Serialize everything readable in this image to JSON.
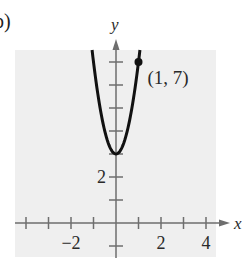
{
  "figure": {
    "part_label": "b)",
    "point_label": "(1, 7)",
    "x_axis_label": "x",
    "y_axis_label": "y",
    "x_tick_labels": [
      {
        "value": -2,
        "text": "−2"
      },
      {
        "value": 2,
        "text": "2"
      },
      {
        "value": 4,
        "text": "4"
      }
    ],
    "y_tick_labels": [
      {
        "value": 2,
        "text": "2"
      }
    ],
    "colors": {
      "background": "#ffffff",
      "plot_area": "#efefef",
      "axis": "#6e6e6e",
      "curve": "#111111",
      "point": "#111111"
    }
  },
  "chart_data": {
    "type": "line",
    "title": "",
    "xlabel": "x",
    "ylabel": "y",
    "function": "y = 4x^2 + 3",
    "series": [
      {
        "name": "parabola",
        "x": [
          -1.2,
          -1.0,
          -0.75,
          -0.5,
          -0.25,
          0,
          0.25,
          0.5,
          0.75,
          1.0,
          1.2
        ],
        "y": [
          8.76,
          7,
          5.25,
          4,
          3.25,
          3,
          3.25,
          4,
          5.25,
          7,
          8.76
        ]
      }
    ],
    "annotations": [
      {
        "type": "point",
        "x": 1,
        "y": 7,
        "label": "(1, 7)"
      },
      {
        "type": "vertex",
        "x": 0,
        "y": 3
      }
    ],
    "x_ticks": [
      -4,
      -3,
      -2,
      -1,
      0,
      1,
      2,
      3,
      4
    ],
    "y_ticks": [
      -1,
      1,
      2,
      3,
      4,
      5,
      6,
      7
    ],
    "x_tick_labels": [
      "-2",
      "2",
      "4"
    ],
    "y_tick_labels": [
      "2"
    ],
    "xlim": [
      -4.5,
      5
    ],
    "ylim": [
      -1.5,
      8
    ],
    "grid": false,
    "legend": null
  }
}
